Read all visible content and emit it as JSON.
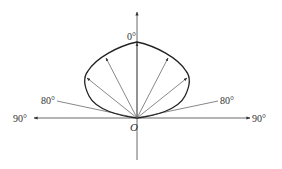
{
  "diagram": {
    "type": "polar radiation pattern",
    "origin_label": "O",
    "labels": {
      "top": "0°",
      "left_80": "80°",
      "right_80": "80°",
      "left_90": "90°",
      "right_90": "90°"
    },
    "colors": {
      "line": "#333333",
      "background": "#ffffff"
    }
  }
}
